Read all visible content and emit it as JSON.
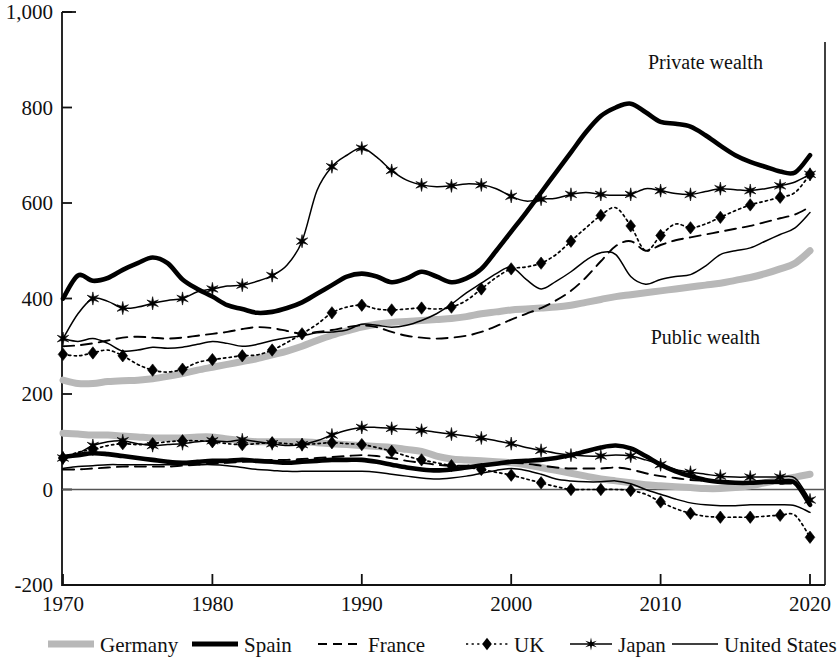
{
  "chart_data": {
    "type": "line",
    "title": "",
    "xlabel": "",
    "ylabel": "",
    "xlim": [
      1970,
      2021
    ],
    "ylim": [
      -200,
      1000
    ],
    "grid": false,
    "legend_position": "bottom",
    "x_ticks": [
      "1970",
      "1980",
      "1990",
      "2000",
      "2010",
      "2020"
    ],
    "x_tick_values": [
      1970,
      1980,
      1990,
      2000,
      2010,
      2020
    ],
    "y_ticks": [
      "1,000",
      "800",
      "600",
      "400",
      "200",
      "0",
      "-200"
    ],
    "y_tick_values": [
      1000,
      800,
      600,
      400,
      200,
      0,
      -200
    ],
    "annotations": [
      {
        "text": "Private wealth",
        "x": 2013,
        "y": 880
      },
      {
        "text": "Public wealth",
        "x": 2013,
        "y": 305
      }
    ],
    "x": [
      1970,
      1971,
      1972,
      1973,
      1974,
      1975,
      1976,
      1977,
      1978,
      1979,
      1980,
      1981,
      1982,
      1983,
      1984,
      1985,
      1986,
      1987,
      1988,
      1989,
      1990,
      1991,
      1992,
      1993,
      1994,
      1995,
      1996,
      1997,
      1998,
      1999,
      2000,
      2001,
      2002,
      2003,
      2004,
      2005,
      2006,
      2007,
      2008,
      2009,
      2010,
      2011,
      2012,
      2013,
      2014,
      2015,
      2016,
      2017,
      2018,
      2019,
      2020
    ],
    "series": [
      {
        "name": "Germany",
        "group": "private",
        "color": "#b8b8b8",
        "style": "thick-gray",
        "marker": "none",
        "values": [
          229,
          222,
          222,
          226,
          228,
          229,
          232,
          237,
          243,
          250,
          256,
          262,
          268,
          274,
          282,
          290,
          300,
          312,
          323,
          332,
          340,
          346,
          350,
          352,
          354,
          356,
          358,
          362,
          368,
          372,
          376,
          378,
          380,
          382,
          386,
          392,
          398,
          404,
          408,
          412,
          416,
          420,
          424,
          428,
          432,
          438,
          444,
          452,
          462,
          474,
          500
        ]
      },
      {
        "name": "Spain",
        "group": "private",
        "color": "#000000",
        "style": "thick-black",
        "marker": "none",
        "values": [
          400,
          448,
          437,
          443,
          460,
          474,
          486,
          474,
          440,
          420,
          404,
          386,
          378,
          370,
          372,
          380,
          392,
          410,
          428,
          446,
          452,
          446,
          434,
          442,
          456,
          446,
          434,
          442,
          462,
          500,
          540,
          580,
          622,
          664,
          706,
          748,
          782,
          800,
          808,
          790,
          770,
          766,
          760,
          742,
          720,
          700,
          686,
          676,
          666,
          664,
          700
        ]
      },
      {
        "name": "France",
        "group": "private",
        "color": "#000000",
        "style": "dashed",
        "marker": "none",
        "values": [
          300,
          302,
          306,
          312,
          318,
          320,
          318,
          316,
          318,
          322,
          326,
          330,
          336,
          340,
          338,
          332,
          326,
          330,
          334,
          340,
          344,
          340,
          330,
          322,
          318,
          316,
          318,
          322,
          330,
          342,
          356,
          368,
          380,
          396,
          416,
          444,
          478,
          510,
          520,
          500,
          512,
          522,
          528,
          534,
          540,
          546,
          552,
          560,
          568,
          576,
          592
        ]
      },
      {
        "name": "UK",
        "group": "private",
        "color": "#000000",
        "style": "dotted",
        "marker": "diamond",
        "values": [
          283,
          280,
          286,
          292,
          280,
          262,
          250,
          246,
          252,
          266,
          272,
          276,
          280,
          282,
          292,
          308,
          326,
          346,
          370,
          382,
          386,
          378,
          376,
          378,
          380,
          378,
          382,
          396,
          420,
          444,
          462,
          466,
          474,
          492,
          520,
          548,
          574,
          590,
          552,
          500,
          532,
          556,
          548,
          556,
          570,
          584,
          596,
          604,
          612,
          622,
          660
        ]
      },
      {
        "name": "Japan",
        "group": "private",
        "color": "#000000",
        "style": "thin-star",
        "marker": "star",
        "values": [
          316,
          368,
          400,
          394,
          380,
          382,
          390,
          396,
          400,
          414,
          420,
          426,
          428,
          436,
          448,
          470,
          520,
          626,
          676,
          700,
          715,
          696,
          668,
          648,
          638,
          634,
          636,
          640,
          638,
          630,
          614,
          604,
          608,
          610,
          618,
          622,
          618,
          616,
          618,
          630,
          626,
          620,
          618,
          624,
          630,
          628,
          626,
          630,
          636,
          644,
          660
        ]
      },
      {
        "name": "United States",
        "group": "private",
        "color": "#000000",
        "style": "thin",
        "marker": "none",
        "values": [
          316,
          310,
          316,
          306,
          290,
          292,
          298,
          296,
          298,
          304,
          310,
          306,
          300,
          304,
          312,
          318,
          322,
          328,
          330,
          334,
          346,
          344,
          340,
          344,
          354,
          368,
          388,
          412,
          432,
          452,
          466,
          440,
          420,
          436,
          456,
          480,
          496,
          492,
          446,
          430,
          440,
          446,
          450,
          468,
          492,
          500,
          506,
          520,
          534,
          548,
          580
        ]
      },
      {
        "name": "Germany",
        "group": "public",
        "color": "#b8b8b8",
        "style": "thick-gray",
        "marker": "none",
        "values": [
          118,
          116,
          114,
          114,
          112,
          110,
          108,
          108,
          108,
          110,
          110,
          106,
          102,
          100,
          100,
          100,
          100,
          98,
          96,
          94,
          92,
          90,
          88,
          84,
          80,
          70,
          64,
          62,
          60,
          58,
          56,
          52,
          46,
          40,
          34,
          28,
          22,
          18,
          14,
          10,
          8,
          6,
          4,
          2,
          2,
          4,
          8,
          14,
          20,
          26,
          32
        ]
      },
      {
        "name": "Spain",
        "group": "public",
        "color": "#000000",
        "style": "thick-black",
        "marker": "none",
        "values": [
          68,
          72,
          76,
          74,
          70,
          66,
          62,
          58,
          56,
          58,
          60,
          60,
          62,
          60,
          58,
          56,
          58,
          60,
          62,
          62,
          62,
          58,
          52,
          46,
          42,
          40,
          42,
          46,
          50,
          54,
          58,
          60,
          62,
          66,
          72,
          80,
          88,
          92,
          86,
          70,
          52,
          38,
          28,
          20,
          16,
          14,
          14,
          16,
          16,
          14,
          -32
        ]
      },
      {
        "name": "France",
        "group": "public",
        "color": "#000000",
        "style": "dashed",
        "marker": "none",
        "values": [
          42,
          42,
          44,
          46,
          48,
          48,
          48,
          48,
          50,
          52,
          54,
          56,
          58,
          60,
          62,
          62,
          64,
          66,
          68,
          70,
          72,
          70,
          66,
          60,
          56,
          52,
          50,
          50,
          52,
          54,
          56,
          54,
          50,
          46,
          44,
          44,
          44,
          46,
          42,
          34,
          28,
          24,
          20,
          18,
          16,
          14,
          14,
          14,
          12,
          10,
          -18
        ]
      },
      {
        "name": "UK",
        "group": "public",
        "color": "#000000",
        "style": "dotted",
        "marker": "diamond",
        "values": [
          66,
          78,
          84,
          92,
          96,
          94,
          96,
          100,
          102,
          102,
          100,
          96,
          94,
          96,
          98,
          96,
          94,
          96,
          98,
          96,
          94,
          88,
          80,
          70,
          62,
          56,
          50,
          46,
          42,
          36,
          30,
          22,
          14,
          6,
          0,
          0,
          0,
          0,
          -2,
          -10,
          -26,
          -40,
          -50,
          -56,
          -58,
          -58,
          -58,
          -56,
          -54,
          -54,
          -100
        ]
      },
      {
        "name": "Japan",
        "group": "public",
        "color": "#000000",
        "style": "thin-star",
        "marker": "star",
        "values": [
          66,
          76,
          92,
          100,
          102,
          96,
          92,
          94,
          96,
          100,
          102,
          100,
          104,
          100,
          96,
          92,
          94,
          102,
          114,
          124,
          130,
          130,
          128,
          126,
          124,
          120,
          116,
          112,
          108,
          102,
          96,
          88,
          82,
          76,
          72,
          70,
          70,
          72,
          70,
          62,
          52,
          42,
          36,
          32,
          28,
          26,
          26,
          26,
          26,
          24,
          -22
        ]
      },
      {
        "name": "United States",
        "group": "public",
        "color": "#000000",
        "style": "thin",
        "marker": "none",
        "values": [
          44,
          48,
          50,
          52,
          52,
          52,
          52,
          52,
          52,
          52,
          52,
          50,
          46,
          42,
          40,
          38,
          38,
          38,
          38,
          38,
          38,
          36,
          32,
          28,
          24,
          22,
          24,
          28,
          34,
          40,
          44,
          40,
          32,
          22,
          18,
          16,
          16,
          18,
          12,
          0,
          -10,
          -20,
          -28,
          -32,
          -34,
          -34,
          -32,
          -32,
          -32,
          -34,
          -48
        ]
      }
    ]
  },
  "legend": {
    "items": [
      {
        "label": "Germany",
        "style": "thick-gray",
        "marker": "none"
      },
      {
        "label": "Spain",
        "style": "thick-black",
        "marker": "none"
      },
      {
        "label": "France",
        "style": "dashed",
        "marker": "none"
      },
      {
        "label": "UK",
        "style": "dotted",
        "marker": "diamond"
      },
      {
        "label": "Japan",
        "style": "thin-star",
        "marker": "star"
      },
      {
        "label": "United States",
        "style": "thin",
        "marker": "none"
      }
    ]
  },
  "colors": {
    "axis": "#111111",
    "gray_series": "#b8b8b8",
    "black_series": "#000000",
    "background": "#ffffff"
  }
}
